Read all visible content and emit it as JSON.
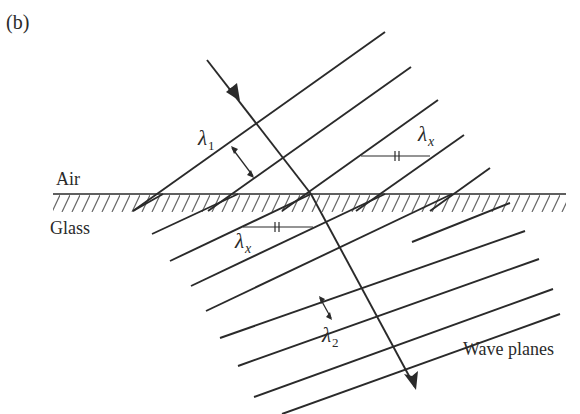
{
  "figure": {
    "panel_label": "(b)",
    "media_labels": {
      "upper": "Air",
      "lower": "Glass"
    },
    "wavelength_labels": {
      "air": {
        "symbol": "λ",
        "subscript": "1"
      },
      "interface_top": {
        "symbol": "λ",
        "subscript": "x"
      },
      "interface_bottom": {
        "symbol": "λ",
        "subscript": "x"
      },
      "glass": {
        "symbol": "λ",
        "subscript": "2"
      }
    },
    "wave_planes_label": "Wave planes",
    "colors": {
      "line": "#2a2a2a",
      "hatch": "#555555",
      "background": "#ffffff"
    }
  }
}
